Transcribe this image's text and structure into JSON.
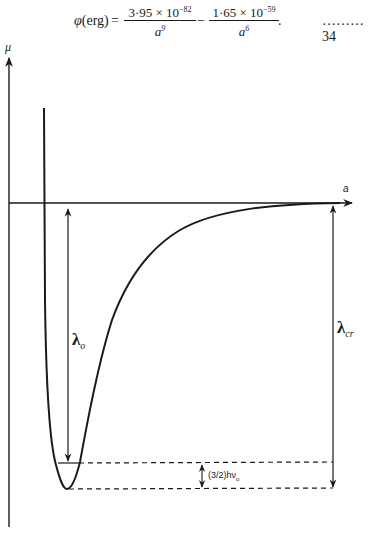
{
  "equation": {
    "lhs_symbol": "φ",
    "lhs_unit": "(erg)",
    "equals": "=",
    "term1": {
      "numerator_coeff": "3·95 × 10",
      "numerator_exp": "−82",
      "denominator_base": "a",
      "denominator_exp": "9"
    },
    "minus": "−",
    "term2": {
      "numerator_coeff": "1·65 × 10",
      "numerator_exp": "−59",
      "denominator_base": "a",
      "denominator_exp": "6"
    },
    "trailing_punct": ".",
    "number": "………34"
  },
  "diagram": {
    "y_axis_label": "μ",
    "x_axis_label": "a",
    "lambda0_symbol": "λ",
    "lambda0_sub": "o",
    "lambdacr_symbol": "λ",
    "lambdacr_sub": "cr",
    "zero_point_label": "(3/2)hν",
    "zero_point_sub": "o"
  }
}
